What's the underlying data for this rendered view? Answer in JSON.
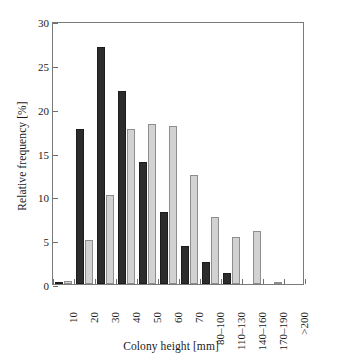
{
  "chart_data": {
    "type": "bar",
    "title": "",
    "xlabel": "Colony height [mm]",
    "ylabel": "Relative frequency [%]",
    "categories": [
      "10",
      "20",
      "30",
      "40",
      "50",
      "60",
      "70",
      "80–100",
      "110–130",
      "140–160",
      "170–190",
      ">200"
    ],
    "series": [
      {
        "name": "series-1",
        "color": "#2c2c2c",
        "values": [
          0.2,
          17.7,
          27.0,
          22.0,
          13.9,
          8.2,
          4.3,
          2.5,
          1.3,
          0.0,
          0.0,
          0.0
        ]
      },
      {
        "name": "series-2",
        "color": "#d2d2d2",
        "values": [
          0.3,
          5.0,
          10.2,
          17.7,
          18.3,
          18.0,
          12.4,
          7.6,
          5.4,
          6.1,
          0.15,
          0.0
        ]
      }
    ],
    "ylim": [
      0,
      30
    ],
    "yticks": [
      0,
      5,
      10,
      15,
      20,
      25,
      30
    ],
    "ytick_labels": [
      "0",
      "5",
      "10",
      "15",
      "20",
      "25",
      "30"
    ],
    "grid": false,
    "legend": "none"
  }
}
